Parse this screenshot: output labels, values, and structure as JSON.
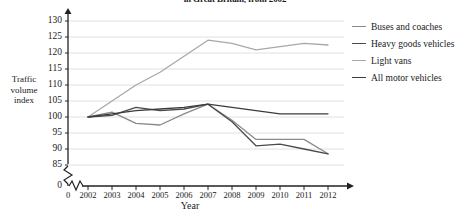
{
  "chart_data": {
    "type": "line",
    "title": "in Great Britain, from 2002",
    "xlabel": "Year",
    "ylabel": "Traffic volume index",
    "categories": [
      "2002",
      "2003",
      "2004",
      "2005",
      "2006",
      "2007",
      "2008",
      "2009",
      "2010",
      "2011",
      "2012"
    ],
    "x": [
      2002,
      2003,
      2004,
      2005,
      2006,
      2007,
      2008,
      2009,
      2010,
      2011,
      2012
    ],
    "ylim": [
      85,
      130
    ],
    "yticks": [
      85,
      90,
      95,
      100,
      105,
      110,
      115,
      120,
      125,
      130
    ],
    "ytick_labels": [
      "85",
      "90",
      "95",
      "100",
      "105",
      "110",
      "115",
      "120",
      "125",
      "130"
    ],
    "y_axis_break": true,
    "y_origin_label": "0",
    "x_origin_label": "0",
    "grid": true,
    "legend_position": "right",
    "series": [
      {
        "name": "Buses and coaches",
        "color": "#8a8a8a",
        "values": [
          100,
          101.5,
          98,
          97.5,
          101,
          104,
          99,
          93,
          93,
          93,
          88.5
        ]
      },
      {
        "name": "Heavy goods vehicles",
        "color": "#4a4a4a",
        "values": [
          100,
          100.5,
          103,
          102,
          102.5,
          104,
          98.5,
          91,
          91.5,
          90,
          88.5
        ]
      },
      {
        "name": "Light vans",
        "color": "#a8a8a8",
        "values": [
          100,
          105,
          110,
          114,
          119,
          124,
          123,
          121,
          122,
          123,
          122.5
        ]
      },
      {
        "name": "All motor vehicles",
        "color": "#3c3c3c",
        "values": [
          100,
          101,
          102,
          102.5,
          103,
          104,
          103,
          102,
          101,
          101,
          101
        ]
      }
    ]
  }
}
